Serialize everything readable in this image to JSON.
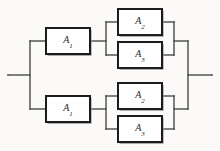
{
  "diagram": {
    "type": "reliability-block-diagram",
    "background_color": "#fbfaf8",
    "line_color": "#4a4a4a",
    "block_border_color": "#1c1c1c",
    "block_fill_color": "#fefefe",
    "label_color": "#2a2a2a",
    "terminals": {
      "input_label": "",
      "output_label": ""
    },
    "blocks": [
      {
        "id": "block-a1-top",
        "name": "A",
        "subscript": "1",
        "branch": "top",
        "stage": "series-first",
        "x": 46,
        "y": 28,
        "width": 44,
        "height": 26
      },
      {
        "id": "block-a2-top",
        "name": "A",
        "subscript": "2",
        "branch": "top",
        "stage": "parallel-upper",
        "x": 118,
        "y": 9,
        "width": 44,
        "height": 26
      },
      {
        "id": "block-a3-top",
        "name": "A",
        "subscript": "3",
        "branch": "top",
        "stage": "parallel-lower",
        "x": 118,
        "y": 42,
        "width": 44,
        "height": 26
      },
      {
        "id": "block-a1-bottom",
        "name": "A",
        "subscript": "1",
        "branch": "bottom",
        "stage": "series-first",
        "x": 46,
        "y": 96,
        "width": 44,
        "height": 26
      },
      {
        "id": "block-a2-bottom",
        "name": "A",
        "subscript": "2",
        "branch": "bottom",
        "stage": "parallel-upper",
        "x": 118,
        "y": 83,
        "width": 44,
        "height": 26
      },
      {
        "id": "block-a3-bottom",
        "name": "A",
        "subscript": "3",
        "branch": "bottom",
        "stage": "parallel-lower",
        "x": 118,
        "y": 116,
        "width": 44,
        "height": 26
      }
    ],
    "connections": [
      {
        "id": "input-stub",
        "kind": "horizontal",
        "x1": 8,
        "y1": 75,
        "x2": 30,
        "y2": 75
      },
      {
        "id": "input-bus",
        "kind": "vertical",
        "x1": 30,
        "y1": 41,
        "x2": 30,
        "y2": 109
      },
      {
        "id": "input-to-a1-top",
        "kind": "horizontal",
        "x1": 30,
        "y1": 41,
        "x2": 46,
        "y2": 41
      },
      {
        "id": "input-to-a1-bottom",
        "kind": "horizontal",
        "x1": 30,
        "y1": 109,
        "x2": 46,
        "y2": 109
      },
      {
        "id": "a1-top-to-fanout",
        "kind": "horizontal",
        "x1": 90,
        "y1": 41,
        "x2": 106,
        "y2": 41
      },
      {
        "id": "fanout-bus-top",
        "kind": "vertical",
        "x1": 106,
        "y1": 22,
        "x2": 106,
        "y2": 55
      },
      {
        "id": "fanout-to-a2-top",
        "kind": "horizontal",
        "x1": 106,
        "y1": 22,
        "x2": 118,
        "y2": 22
      },
      {
        "id": "fanout-to-a3-top",
        "kind": "horizontal",
        "x1": 106,
        "y1": 55,
        "x2": 118,
        "y2": 55
      },
      {
        "id": "a2-top-to-merge",
        "kind": "horizontal",
        "x1": 162,
        "y1": 22,
        "x2": 174,
        "y2": 22
      },
      {
        "id": "a3-top-to-merge",
        "kind": "horizontal",
        "x1": 162,
        "y1": 55,
        "x2": 174,
        "y2": 55
      },
      {
        "id": "merge-bus-top",
        "kind": "vertical",
        "x1": 174,
        "y1": 22,
        "x2": 174,
        "y2": 55
      },
      {
        "id": "merge-top-to-output",
        "kind": "horizontal",
        "x1": 174,
        "y1": 41,
        "x2": 188,
        "y2": 41
      },
      {
        "id": "a1-bottom-to-fanout",
        "kind": "horizontal",
        "x1": 90,
        "y1": 109,
        "x2": 106,
        "y2": 109
      },
      {
        "id": "fanout-bus-bottom",
        "kind": "vertical",
        "x1": 106,
        "y1": 96,
        "x2": 106,
        "y2": 129
      },
      {
        "id": "fanout-to-a2-bottom",
        "kind": "horizontal",
        "x1": 106,
        "y1": 96,
        "x2": 118,
        "y2": 96
      },
      {
        "id": "fanout-to-a3-bottom",
        "kind": "horizontal",
        "x1": 106,
        "y1": 129,
        "x2": 118,
        "y2": 129
      },
      {
        "id": "a2-bottom-to-merge",
        "kind": "horizontal",
        "x1": 162,
        "y1": 96,
        "x2": 174,
        "y2": 96
      },
      {
        "id": "a3-bottom-to-merge",
        "kind": "horizontal",
        "x1": 162,
        "y1": 129,
        "x2": 174,
        "y2": 129
      },
      {
        "id": "merge-bus-bottom",
        "kind": "vertical",
        "x1": 174,
        "y1": 96,
        "x2": 174,
        "y2": 129
      },
      {
        "id": "merge-bottom-to-output",
        "kind": "horizontal",
        "x1": 174,
        "y1": 109,
        "x2": 188,
        "y2": 109
      },
      {
        "id": "output-bus",
        "kind": "vertical",
        "x1": 188,
        "y1": 41,
        "x2": 188,
        "y2": 109
      },
      {
        "id": "output-stub",
        "kind": "horizontal",
        "x1": 188,
        "y1": 75,
        "x2": 212,
        "y2": 75
      }
    ]
  }
}
